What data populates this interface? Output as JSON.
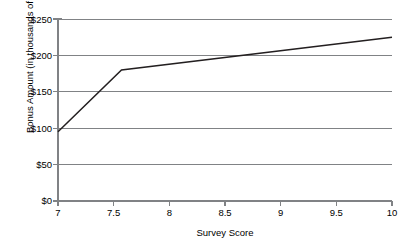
{
  "chart_data": {
    "type": "line",
    "title": "",
    "subtitle": "",
    "xlabel": "Survey Score",
    "ylabel": "Bonus Amount (in thousands of $)",
    "xlim": [
      7,
      10
    ],
    "ylim": [
      0,
      250
    ],
    "xticks": [
      "7",
      "7.5",
      "8",
      "8.5",
      "9",
      "9.5",
      "10"
    ],
    "xtick_values": [
      7,
      7.5,
      8,
      8.5,
      9,
      9.5,
      10
    ],
    "yticks": [
      "$0",
      "$50",
      "$100",
      "$150",
      "$200",
      "$250"
    ],
    "ytick_values": [
      0,
      50,
      100,
      150,
      200,
      250
    ],
    "grid": "horizontal",
    "legend": "none",
    "series": [
      {
        "name": "Bonus Amount",
        "color": "#231f20",
        "x": [
          7,
          7.57,
          10
        ],
        "values": [
          95,
          180,
          225
        ],
        "points": [
          {
            "x": 7,
            "y": 95
          },
          {
            "x": 7.57,
            "y": 180
          },
          {
            "x": 10,
            "y": 225
          }
        ]
      }
    ],
    "annotations": []
  },
  "style": {
    "grid_color": "#808285",
    "axis_color": "#808285",
    "line_color": "#231f20",
    "background": "#ffffff"
  }
}
